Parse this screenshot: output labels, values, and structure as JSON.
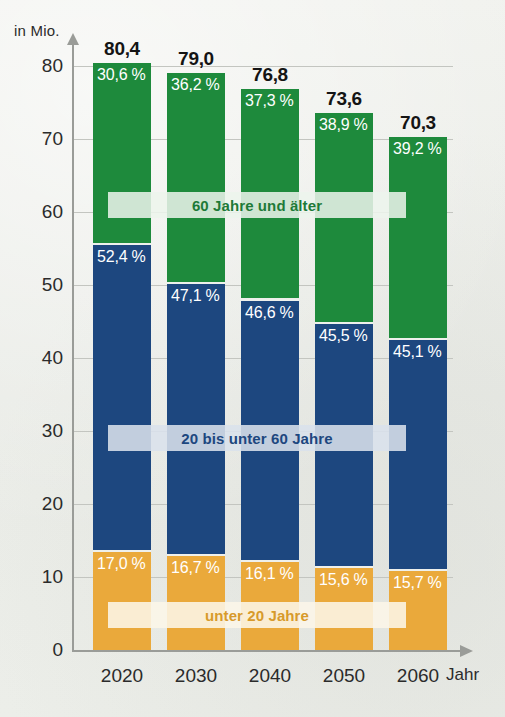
{
  "chart_data": {
    "type": "bar",
    "subtype": "stacked-bar-100-percent-absolute",
    "title": "",
    "xlabel": "Jahr",
    "ylabel": "in Mio.",
    "ylim": [
      0,
      80
    ],
    "yticks": [
      0,
      10,
      20,
      30,
      40,
      50,
      60,
      70,
      80
    ],
    "ytick_labels": [
      "0",
      "10",
      "20",
      "30",
      "40",
      "50",
      "60",
      "70",
      "80"
    ],
    "grid": true,
    "legend_position": "inside-bands",
    "categories": [
      "2020",
      "2030",
      "2040",
      "2050",
      "2060"
    ],
    "totals": [
      80.4,
      79.0,
      76.8,
      73.6,
      70.3
    ],
    "total_labels": [
      "80,4",
      "79,0",
      "76,8",
      "73,6",
      "70,3"
    ],
    "series": [
      {
        "name": "60 Jahre und älter",
        "color": "#1e8a3c",
        "values": [
          30.6,
          36.2,
          37.3,
          38.9,
          39.2
        ],
        "labels": [
          "30,6 %",
          "36,2 %",
          "37,3 %",
          "38,9 %",
          "39,2 %"
        ]
      },
      {
        "name": "20 bis unter 60 Jahre",
        "color": "#1d477f",
        "values": [
          52.4,
          47.1,
          46.6,
          45.5,
          45.1
        ],
        "labels": [
          "52,4 %",
          "47,1 %",
          "46,6 %",
          "45,5 %",
          "45,1 %"
        ]
      },
      {
        "name": "unter 20 Jahre",
        "color": "#eaa93b",
        "values": [
          17.0,
          16.7,
          16.1,
          15.6,
          15.7
        ],
        "labels": [
          "17,0 %",
          "16,7 %",
          "16,1 %",
          "15,6 %",
          "15,7 %"
        ]
      }
    ]
  },
  "axes": {
    "y_unit_label": "in Mio.",
    "x_title": "Jahr"
  },
  "legend": {
    "older_label": "60 Jahre und älter",
    "middle_label": "20 bis unter 60 Jahre",
    "young_label": "unter 20 Jahre"
  },
  "colors": {
    "older": "#1e8a3c",
    "middle": "#1d477f",
    "young": "#eaa93b",
    "background": "#edeeea",
    "axis": "#9a9c98",
    "grid": "#c3c5c0",
    "text": "#2b2b2b"
  }
}
